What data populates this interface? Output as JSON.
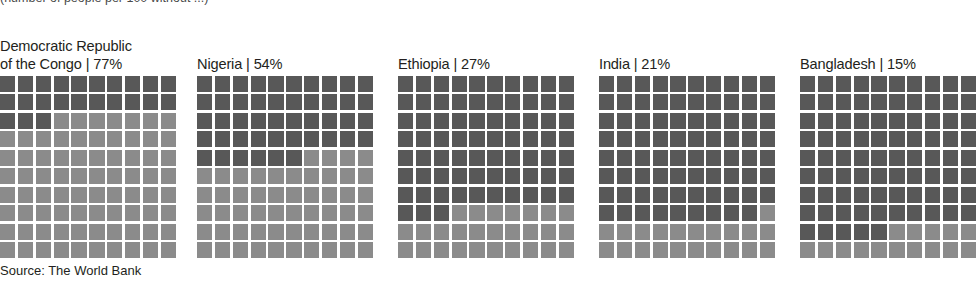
{
  "clipped_heading_text": "(number of people per 100 without ...)",
  "source": {
    "label": "Source: The World Bank"
  },
  "colors": {
    "dark": "#585858",
    "light": "#8b8b8b",
    "grid_gap": "#ffffff",
    "text": "#231f20",
    "background": "#ffffff"
  },
  "panels": [
    {
      "name": "democratic-republic-of-the-congo",
      "country": "Democratic Republic\nof the Congo",
      "percent": 77,
      "percent_label": "77%",
      "label": "Democratic Republic\nof the Congo | 77%",
      "left": 0,
      "grid": {
        "rows": 10,
        "cols": 10,
        "total": 100,
        "dark_cells": 23,
        "light_cells": 77
      }
    },
    {
      "name": "nigeria",
      "country": "Nigeria",
      "percent": 54,
      "percent_label": "54%",
      "label": "Nigeria | 54%",
      "left": 197,
      "grid": {
        "rows": 10,
        "cols": 10,
        "total": 100,
        "dark_cells": 46,
        "light_cells": 54
      }
    },
    {
      "name": "ethiopia",
      "country": "Ethiopia",
      "percent": 27,
      "percent_label": "27%",
      "label": "Ethiopia | 27%",
      "left": 398,
      "grid": {
        "rows": 10,
        "cols": 10,
        "total": 100,
        "dark_cells": 73,
        "light_cells": 27
      }
    },
    {
      "name": "india",
      "country": "India",
      "percent": 21,
      "percent_label": "21%",
      "label": "India | 21%",
      "left": 599,
      "grid": {
        "rows": 10,
        "cols": 10,
        "total": 100,
        "dark_cells": 79,
        "light_cells": 21
      }
    },
    {
      "name": "bangladesh",
      "country": "Bangladesh",
      "percent": 15,
      "percent_label": "15%",
      "label": "Bangladesh | 15%",
      "left": 800,
      "grid": {
        "rows": 10,
        "cols": 10,
        "total": 100,
        "dark_cells": 85,
        "light_cells": 15
      }
    }
  ],
  "chart_data": {
    "type": "waffle",
    "title": "",
    "subtitle": "",
    "xlabel": "",
    "ylabel": "",
    "grid": false,
    "legend_position": "none",
    "unit": "percent of population",
    "cell_value": 1,
    "cells_per_chart": 100,
    "fill_direction": "dark fills from top-left, light fills remainder toward bottom-right",
    "encoding": "labelled percentage is rendered as the LIGHT cells; the complement is rendered as DARK cells",
    "categories": [
      "Democratic Republic of the Congo",
      "Nigeria",
      "Ethiopia",
      "India",
      "Bangladesh"
    ],
    "values": [
      77,
      54,
      27,
      21,
      15
    ],
    "series": [
      {
        "name": "Labelled share (light cells)",
        "values": [
          77,
          54,
          27,
          21,
          15
        ]
      },
      {
        "name": "Complement (dark cells)",
        "values": [
          23,
          46,
          73,
          79,
          85
        ]
      }
    ],
    "annotations": [
      "Source: The World Bank"
    ],
    "source": "The World Bank"
  }
}
